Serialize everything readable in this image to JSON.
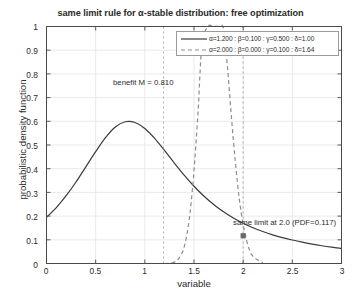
{
  "chart_data": {
    "type": "line",
    "title": "same limit rule for α-stable distribution: free optimization",
    "xlabel": "variable",
    "ylabel": "probabilistic density function",
    "xlim": [
      0,
      3
    ],
    "ylim": [
      0,
      1
    ],
    "grid": true,
    "xticks": [
      "0",
      "0.5",
      "1",
      "1.5",
      "2",
      "2.5",
      "3"
    ],
    "xtick_values": [
      0,
      0.5,
      1,
      1.5,
      2,
      2.5,
      3
    ],
    "yticks": [
      "0",
      "0.1",
      "0.2",
      "0.3",
      "0.4",
      "0.5",
      "0.6",
      "0.7",
      "0.8",
      "0.9",
      "1"
    ],
    "ytick_values": [
      0,
      0.1,
      0.2,
      0.3,
      0.4,
      0.5,
      0.6,
      0.7,
      0.8,
      0.9,
      1
    ],
    "legend_position": "top-right",
    "series": [
      {
        "name": "α=1.200 : β=0.100 : γ=0.500 : δ=1.00",
        "style": "solid",
        "color": "#3a3a3a",
        "params": {
          "alpha": 1.2,
          "beta": 0.1,
          "gamma": 0.5,
          "delta": 1.0
        },
        "x": [
          0.0,
          0.1,
          0.2,
          0.3,
          0.4,
          0.5,
          0.6,
          0.7,
          0.8,
          0.9,
          1.0,
          1.1,
          1.2,
          1.3,
          1.4,
          1.5,
          1.6,
          1.7,
          1.8,
          1.9,
          2.0,
          2.1,
          2.2,
          2.3,
          2.4,
          2.5,
          2.6,
          2.7,
          2.8,
          2.9,
          3.0
        ],
        "values": [
          0.195,
          0.236,
          0.286,
          0.344,
          0.408,
          0.472,
          0.531,
          0.576,
          0.598,
          0.595,
          0.57,
          0.528,
          0.477,
          0.424,
          0.373,
          0.326,
          0.285,
          0.249,
          0.218,
          0.192,
          0.17,
          0.151,
          0.135,
          0.121,
          0.109,
          0.099,
          0.09,
          0.082,
          0.075,
          0.069,
          0.064
        ]
      },
      {
        "name": "α=2.000 : β=0.000 : γ=0.100 : δ=1.64",
        "style": "dashed",
        "color": "#8d8d8d",
        "params": {
          "alpha": 2.0,
          "beta": 0.0,
          "gamma": 0.1,
          "delta": 1.64
        },
        "x": [
          1.2,
          1.25,
          1.3,
          1.34,
          1.38,
          1.4,
          1.42,
          1.44,
          1.46,
          1.48,
          1.5,
          1.54,
          1.58,
          1.64,
          1.7,
          1.76,
          1.8,
          1.84,
          1.88,
          1.92,
          1.96,
          2.0,
          2.05,
          2.1,
          2.2
        ],
        "values": [
          0.0,
          0.001,
          0.006,
          0.018,
          0.045,
          0.07,
          0.105,
          0.153,
          0.215,
          0.295,
          0.391,
          0.63,
          0.92,
          1.0,
          1.0,
          1.0,
          0.99,
          0.83,
          0.62,
          0.43,
          0.275,
          0.165,
          0.075,
          0.03,
          0.003
        ]
      }
    ],
    "annotations": [
      {
        "name": "benefit-annotation",
        "text": "benefit M = 0.810",
        "x": 1.19,
        "y": 0.745
      },
      {
        "name": "same-limit-annotation",
        "text": "same limit at 2.0 (PDF=0.117)",
        "x": 2.06,
        "y": 0.155
      }
    ],
    "reference_lines": [
      {
        "name": "benefit-vline",
        "x": 1.19,
        "style": "dotted"
      },
      {
        "name": "limit-vline",
        "x": 2.0,
        "style": "dotted"
      }
    ],
    "markers": [
      {
        "name": "limit-marker",
        "x": 2.0,
        "y": 0.117,
        "shape": "square",
        "color": "#6a6a6a"
      }
    ]
  },
  "colors": {
    "axis": "#4a4a4a",
    "grid": "#e4e4e4",
    "text": "#2b2b2b",
    "series_1": "#3a3a3a",
    "series_2": "#8d8d8d",
    "legend_border": "#9a9a9a"
  }
}
